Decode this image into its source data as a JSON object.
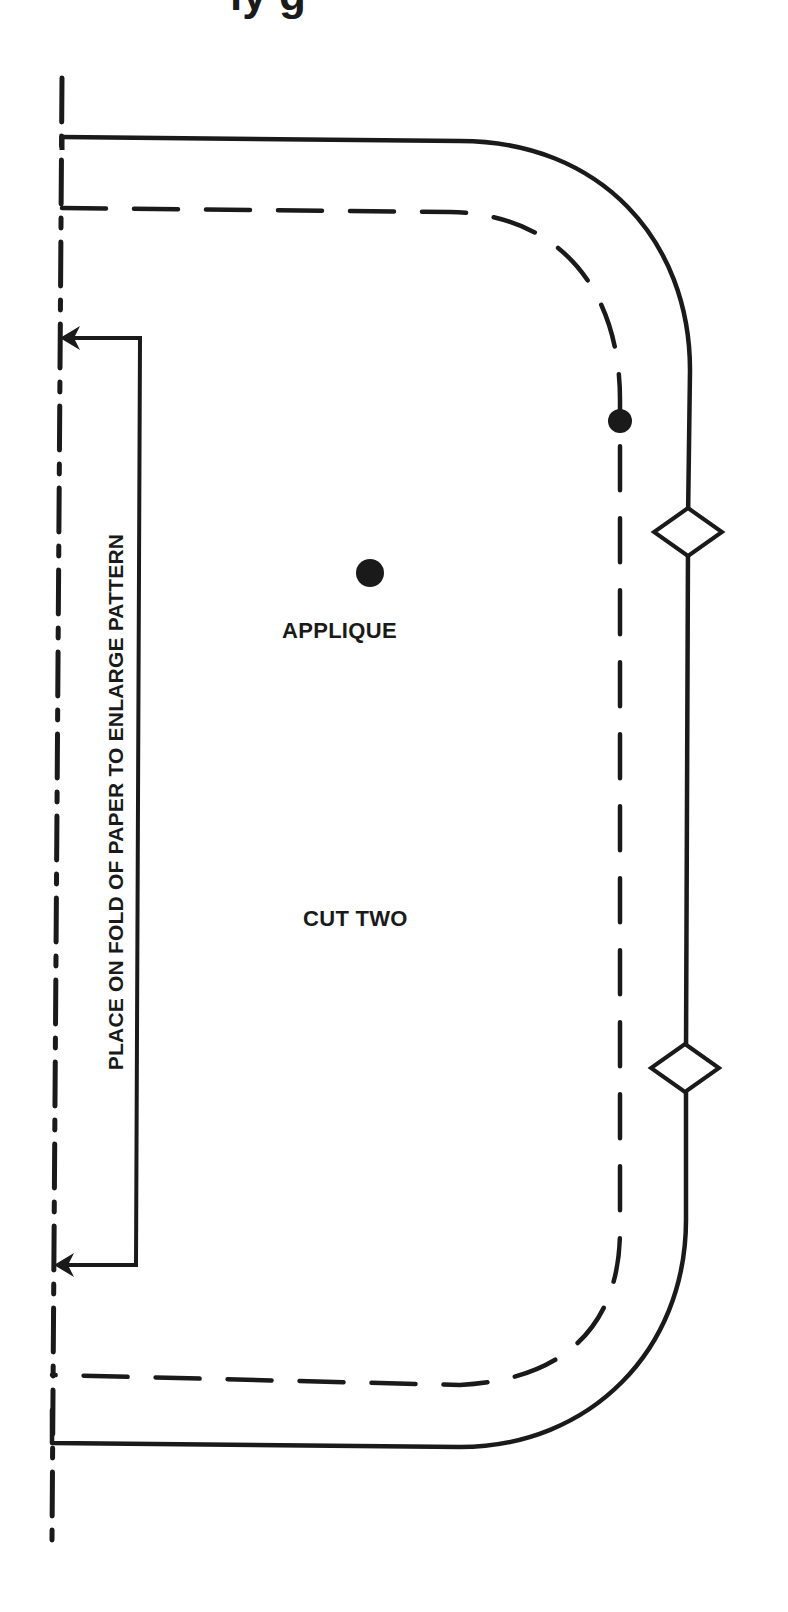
{
  "title_fragment": "ly g",
  "pattern": {
    "labels": {
      "applique": "APPLIQUE",
      "cut": "CUT TWO",
      "fold_instruction": "PLACE ON FOLD OF PAPER TO ENLARGE PATTERN"
    },
    "markings": {
      "fold_line": "dash-dot",
      "cutting_line": "solid",
      "seam_line": "dashed",
      "notches": 2,
      "dots": 2
    },
    "colors": {
      "line": "#1a1a1a",
      "background": "#ffffff"
    }
  }
}
